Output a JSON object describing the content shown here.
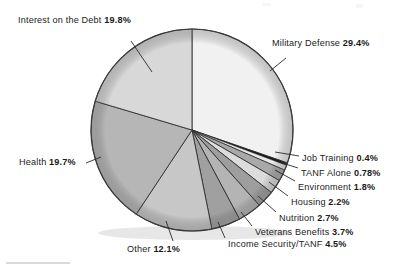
{
  "figure": {
    "kind": "pie-chart",
    "background": "#ffffff",
    "label_color": "#1b1b1b"
  },
  "chart_data": {
    "type": "pie",
    "title": "",
    "subtitle": "",
    "xlabel": "",
    "ylabel": "",
    "grid": false,
    "legend_position": "callout-labels",
    "start_angle_deg": 0,
    "direction": "clockwise",
    "value_unit": "percent",
    "categories": [
      "Military Defense",
      "Job Training",
      "TANF Alone",
      "Environment",
      "Housing",
      "Nutrition",
      "Veterans Benefits",
      "Income Security/TANF",
      "Other",
      "Health",
      "Interest on the Debt"
    ],
    "values": [
      29.4,
      0.4,
      0.78,
      1.8,
      2.2,
      2.7,
      3.7,
      4.5,
      12.1,
      19.7,
      19.8
    ],
    "value_labels": [
      "29.4%",
      "0.4%",
      "0.78%",
      "1.8%",
      "2.2%",
      "2.7%",
      "3.7%",
      "4.5%",
      "12.1%",
      "19.7%",
      "19.8%"
    ],
    "slice_colors": [
      "#f1f1f1",
      "#1a1a1a",
      "#e9e9e9",
      "#a9a9a9",
      "#dcdcdc",
      "#9e9e9e",
      "#b4b4b4",
      "#a0a0a0",
      "#c7c7c7",
      "#b6b6b6",
      "#d8d8d8"
    ],
    "slices": [
      {
        "name": "Military Defense",
        "value": 29.4,
        "label": "Military Defense 29.4%",
        "color": "#f1f1f1"
      },
      {
        "name": "Job Training",
        "value": 0.4,
        "label": "Job Training 0.4%",
        "color": "#1a1a1a"
      },
      {
        "name": "TANF Alone",
        "value": 0.78,
        "label": "TANF Alone 0.78%",
        "color": "#e9e9e9"
      },
      {
        "name": "Environment",
        "value": 1.8,
        "label": "Environment 1.8%",
        "color": "#a9a9a9"
      },
      {
        "name": "Housing",
        "value": 2.2,
        "label": "Housing 2.2%",
        "color": "#dcdcdc"
      },
      {
        "name": "Nutrition",
        "value": 2.7,
        "label": "Nutrition 2.7%",
        "color": "#9e9e9e"
      },
      {
        "name": "Veterans Benefits",
        "value": 3.7,
        "label": "Veterans Benefits 3.7%",
        "color": "#b4b4b4"
      },
      {
        "name": "Income Security/TANF",
        "value": 4.5,
        "label": "Income Security/TANF 4.5%",
        "color": "#a0a0a0"
      },
      {
        "name": "Other",
        "value": 12.1,
        "label": "Other 12.1%",
        "color": "#c7c7c7"
      },
      {
        "name": "Health",
        "value": 19.7,
        "label": "Health 19.7%",
        "color": "#b6b6b6"
      },
      {
        "name": "Interest on the Debt",
        "value": 19.8,
        "label": "Interest on the Debt 19.8%",
        "color": "#d8d8d8"
      }
    ]
  },
  "labels": {
    "interest_on_debt": {
      "name": "Interest on the Debt",
      "pct": "19.8%"
    },
    "military_defense": {
      "name": "Military Defense",
      "pct": "29.4%"
    },
    "job_training": {
      "name": "Job Training",
      "pct": "0.4%"
    },
    "tanf_alone": {
      "name": "TANF Alone",
      "pct": "0.78%"
    },
    "environment": {
      "name": "Environment",
      "pct": "1.8%"
    },
    "housing": {
      "name": "Housing",
      "pct": "2.2%"
    },
    "nutrition": {
      "name": "Nutrition",
      "pct": "2.7%"
    },
    "veterans_benefits": {
      "name": "Veterans Benefits",
      "pct": "3.7%"
    },
    "income_security": {
      "name": "Income Security/TANF",
      "pct": "4.5%"
    },
    "other": {
      "name": "Other",
      "pct": "12.1%"
    },
    "health": {
      "name": "Health",
      "pct": "19.7%"
    }
  }
}
